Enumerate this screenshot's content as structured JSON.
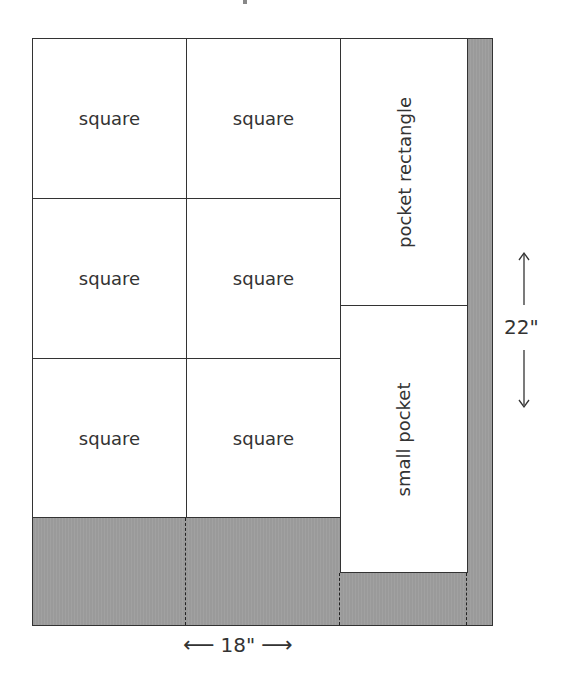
{
  "diagram": {
    "type": "cutting-layout",
    "pieces": [
      {
        "label": "square",
        "row": 1,
        "col": 1
      },
      {
        "label": "square",
        "row": 1,
        "col": 2
      },
      {
        "label": "square",
        "row": 2,
        "col": 1
      },
      {
        "label": "square",
        "row": 2,
        "col": 2
      },
      {
        "label": "square",
        "row": 3,
        "col": 1
      },
      {
        "label": "square",
        "row": 3,
        "col": 2
      },
      {
        "label": "pocket rectangle",
        "orientation": "vertical"
      },
      {
        "label": "small pocket",
        "orientation": "vertical"
      }
    ],
    "dimensions": {
      "width": {
        "label": "18\"",
        "left_arrow": "⟵",
        "right_arrow": "⟶"
      },
      "height": {
        "label": "22\"",
        "up_arrow": "↑",
        "down_arrow": "↓"
      }
    },
    "colors": {
      "waste": "#9a9a9a",
      "outline": "#333333",
      "piece": "#ffffff"
    }
  }
}
